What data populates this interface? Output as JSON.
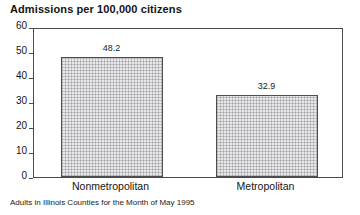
{
  "chart_data": {
    "type": "bar",
    "title": "Admissions per 100,000 citizens",
    "subtitle": "Adults in Illinois Counties for the Month of May 1995",
    "xlabel": "",
    "ylabel": "",
    "ylim": [
      0,
      60
    ],
    "yticks": [
      0,
      10,
      20,
      30,
      40,
      50,
      60
    ],
    "ytick_labels": [
      "0",
      "10",
      "20",
      "30",
      "40",
      "50",
      "60"
    ],
    "grid": false,
    "legend": false,
    "categories": [
      "Nonmetropolitan",
      "Metropolitan"
    ],
    "values": [
      48.2,
      32.9
    ],
    "value_labels": [
      "48.2",
      "32.9"
    ],
    "bar_fill": "#e9e9e9",
    "bar_edge": "#4e4e4e",
    "axis_color": "#4a4a4a",
    "text_color": "#141414"
  }
}
